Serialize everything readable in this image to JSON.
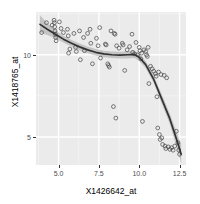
{
  "chart_data": {
    "type": "scatter",
    "title": "",
    "subtitle": "",
    "xlabel": "X1426642_at",
    "ylabel": "X1418765_at",
    "xlim": [
      3.6,
      12.9
    ],
    "ylim": [
      3.3,
      12.6
    ],
    "xticks": [
      5.0,
      7.5,
      10.0,
      12.5
    ],
    "xticklabels": [
      "5.0",
      "7.5",
      "10.0",
      "12.5"
    ],
    "yticks": [
      5,
      10
    ],
    "yticklabels": [
      "5",
      "10"
    ],
    "grid": true,
    "grid_major_color": "#ffffff",
    "grid_minor_color": "#f5f5f5",
    "panel_background": "#ebebeb",
    "legend": null,
    "point_marker": "open-circle",
    "point_color": "#4d4d4d",
    "smooth_line_color": "#333333",
    "confidence_band_color": "#b3b3b3",
    "points": [
      {
        "x": 3.95,
        "y": 11.35
      },
      {
        "x": 4.25,
        "y": 11.95
      },
      {
        "x": 4.6,
        "y": 11.8
      },
      {
        "x": 4.72,
        "y": 12.1
      },
      {
        "x": 4.74,
        "y": 11.95
      },
      {
        "x": 4.76,
        "y": 11.7
      },
      {
        "x": 4.78,
        "y": 11.45
      },
      {
        "x": 4.8,
        "y": 11.25
      },
      {
        "x": 4.82,
        "y": 11.05
      },
      {
        "x": 4.85,
        "y": 10.85
      },
      {
        "x": 5.05,
        "y": 12.0
      },
      {
        "x": 5.15,
        "y": 11.6
      },
      {
        "x": 5.3,
        "y": 11.35
      },
      {
        "x": 5.55,
        "y": 11.55
      },
      {
        "x": 5.6,
        "y": 11.15
      },
      {
        "x": 5.62,
        "y": 10.1
      },
      {
        "x": 5.7,
        "y": 10.35
      },
      {
        "x": 5.95,
        "y": 11.3
      },
      {
        "x": 6.05,
        "y": 10.45
      },
      {
        "x": 6.1,
        "y": 10.2
      },
      {
        "x": 6.3,
        "y": 11.45
      },
      {
        "x": 6.35,
        "y": 9.7
      },
      {
        "x": 6.55,
        "y": 11.05
      },
      {
        "x": 6.6,
        "y": 10.25
      },
      {
        "x": 6.8,
        "y": 11.3
      },
      {
        "x": 6.95,
        "y": 11.55
      },
      {
        "x": 7.0,
        "y": 10.7
      },
      {
        "x": 7.1,
        "y": 9.45
      },
      {
        "x": 7.35,
        "y": 11.0
      },
      {
        "x": 7.45,
        "y": 10.55
      },
      {
        "x": 7.55,
        "y": 11.65
      },
      {
        "x": 7.6,
        "y": 9.8
      },
      {
        "x": 7.9,
        "y": 10.65
      },
      {
        "x": 7.95,
        "y": 10.6
      },
      {
        "x": 8.05,
        "y": 9.45
      },
      {
        "x": 8.1,
        "y": 9.35
      },
      {
        "x": 8.15,
        "y": 9.25
      },
      {
        "x": 8.25,
        "y": 11.45
      },
      {
        "x": 8.4,
        "y": 6.85
      },
      {
        "x": 8.45,
        "y": 11.3
      },
      {
        "x": 8.5,
        "y": 11.25
      },
      {
        "x": 8.55,
        "y": 6.15
      },
      {
        "x": 8.6,
        "y": 10.55
      },
      {
        "x": 8.75,
        "y": 10.4
      },
      {
        "x": 8.95,
        "y": 10.7
      },
      {
        "x": 9.0,
        "y": 10.6
      },
      {
        "x": 9.1,
        "y": 9.05
      },
      {
        "x": 9.25,
        "y": 10.3
      },
      {
        "x": 9.4,
        "y": 10.5
      },
      {
        "x": 9.55,
        "y": 11.25
      },
      {
        "x": 9.6,
        "y": 10.15
      },
      {
        "x": 9.7,
        "y": 10.05
      },
      {
        "x": 9.8,
        "y": 10.75
      },
      {
        "x": 9.9,
        "y": 10.0
      },
      {
        "x": 10.0,
        "y": 10.45
      },
      {
        "x": 10.05,
        "y": 10.25
      },
      {
        "x": 10.1,
        "y": 9.75
      },
      {
        "x": 10.15,
        "y": 10.1
      },
      {
        "x": 10.2,
        "y": 5.95
      },
      {
        "x": 10.3,
        "y": 10.3
      },
      {
        "x": 10.4,
        "y": 10.2
      },
      {
        "x": 10.45,
        "y": 10.0
      },
      {
        "x": 10.5,
        "y": 9.9
      },
      {
        "x": 10.55,
        "y": 10.45
      },
      {
        "x": 10.6,
        "y": 8.25
      },
      {
        "x": 10.7,
        "y": 9.3
      },
      {
        "x": 10.8,
        "y": 9.15
      },
      {
        "x": 10.9,
        "y": 9.0
      },
      {
        "x": 11.0,
        "y": 8.85
      },
      {
        "x": 11.05,
        "y": 8.7
      },
      {
        "x": 11.1,
        "y": 7.45
      },
      {
        "x": 11.15,
        "y": 5.55
      },
      {
        "x": 11.2,
        "y": 8.95
      },
      {
        "x": 11.25,
        "y": 5.15
      },
      {
        "x": 11.3,
        "y": 4.85
      },
      {
        "x": 11.35,
        "y": 8.8
      },
      {
        "x": 11.4,
        "y": 4.95
      },
      {
        "x": 11.45,
        "y": 4.55
      },
      {
        "x": 11.55,
        "y": 8.75
      },
      {
        "x": 11.6,
        "y": 4.45
      },
      {
        "x": 11.65,
        "y": 4.3
      },
      {
        "x": 11.7,
        "y": 8.6
      },
      {
        "x": 11.8,
        "y": 4.4
      },
      {
        "x": 11.9,
        "y": 4.25
      },
      {
        "x": 12.0,
        "y": 4.35
      },
      {
        "x": 12.1,
        "y": 4.2
      },
      {
        "x": 12.2,
        "y": 4.45
      },
      {
        "x": 12.3,
        "y": 5.35
      },
      {
        "x": 12.4,
        "y": 4.65
      },
      {
        "x": 12.45,
        "y": 4.2
      },
      {
        "x": 12.5,
        "y": 3.95
      }
    ],
    "smooth": {
      "x": [
        3.85,
        4.3,
        4.8,
        5.3,
        5.8,
        6.3,
        6.8,
        7.3,
        7.8,
        8.3,
        8.8,
        9.3,
        9.7,
        10.0,
        10.4,
        10.9,
        11.4,
        11.9,
        12.4,
        12.6
      ],
      "y": [
        11.85,
        11.55,
        11.25,
        10.95,
        10.7,
        10.48,
        10.3,
        10.15,
        10.05,
        10.0,
        9.98,
        10.0,
        10.02,
        9.85,
        9.4,
        8.5,
        7.3,
        6.1,
        4.6,
        3.95
      ],
      "ymin": [
        11.35,
        11.2,
        11.0,
        10.75,
        10.5,
        10.28,
        10.1,
        9.95,
        9.85,
        9.8,
        9.78,
        9.78,
        9.8,
        9.62,
        9.18,
        8.28,
        7.02,
        5.78,
        4.1,
        3.35
      ],
      "ymax": [
        12.4,
        11.92,
        11.5,
        11.15,
        10.9,
        10.68,
        10.5,
        10.35,
        10.25,
        10.2,
        10.18,
        10.22,
        10.24,
        10.08,
        9.62,
        8.72,
        7.58,
        6.42,
        5.1,
        4.55
      ]
    }
  }
}
